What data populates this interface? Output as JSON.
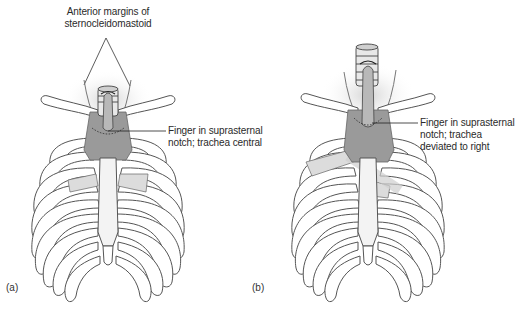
{
  "figure_a": {
    "panel_label": "(a)",
    "top_label_line1": "Anterior margins of",
    "top_label_line2": "sternocleidomastoid",
    "callout_line1": "Finger in suprasternal",
    "callout_line2": "notch; trachea central"
  },
  "figure_b": {
    "panel_label": "(b)",
    "callout_line1": "Finger in suprasternal",
    "callout_line2": "notch; trachea",
    "callout_line3": "deviated to right"
  },
  "colors": {
    "line": "#555555",
    "muscle_fill": "#9a9a9a",
    "bone_fill": "#ffffff",
    "cartilage_fill": "#e6e6e6",
    "shadow": "#d9d9d9"
  }
}
